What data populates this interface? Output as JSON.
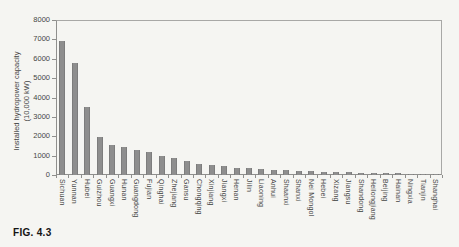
{
  "figure": {
    "caption": "FIG. 4.3"
  },
  "chart_data": {
    "type": "bar",
    "title": "",
    "xlabel": "",
    "ylabel": "Installed hydropower capacity",
    "ylabel_unit": "(10,000 kW)",
    "ylim": [
      0,
      8000
    ],
    "y_ticks": [
      8000,
      7000,
      6000,
      5000,
      4000,
      3000,
      2000,
      1000,
      0
    ],
    "grid": false,
    "legend": false,
    "bar_color": "#8e8e8e",
    "axis_color": "#8f8f8d",
    "categories": [
      "Sichuan",
      "Yunnan",
      "Hubei",
      "Guizhou",
      "Guangxi",
      "Hunan",
      "Guangdong",
      "Fujian",
      "Qinghai",
      "Zhejiang",
      "Gansu",
      "Chongqing",
      "Xinjiang",
      "Jiangxi",
      "Henan",
      "Jilin",
      "Liaoning",
      "Anhui",
      "Shaanxi",
      "Shanxi",
      "Nei Mongol",
      "Hebei",
      "Xizang",
      "Jiangsu",
      "Shandong",
      "Heilongjiang",
      "Beijing",
      "Hainan",
      "Ningxia",
      "Tianjin",
      "Shanghai"
    ],
    "values": [
      6900,
      5780,
      3530,
      1960,
      1560,
      1430,
      1280,
      1180,
      1000,
      880,
      730,
      560,
      500,
      440,
      380,
      340,
      300,
      270,
      250,
      230,
      210,
      170,
      155,
      140,
      125,
      110,
      95,
      80,
      55,
      25,
      10
    ]
  }
}
